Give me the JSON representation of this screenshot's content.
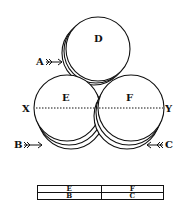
{
  "diagram": {
    "circles": [
      {
        "id": "D",
        "label": "D",
        "cx": 98,
        "cy": 49,
        "r": 32
      },
      {
        "id": "E",
        "label": "E",
        "cx": 67,
        "cy": 108,
        "r": 33
      },
      {
        "id": "F",
        "label": "F",
        "cx": 131,
        "cy": 108,
        "r": 33
      }
    ],
    "axis": {
      "left_label": "X",
      "right_label": "Y"
    },
    "arrows": [
      {
        "label": "A",
        "target": "D"
      },
      {
        "label": "B",
        "target": "E"
      },
      {
        "label": "C",
        "target": "F"
      }
    ]
  },
  "table": {
    "rows": [
      [
        "E",
        "F"
      ],
      [
        "B",
        "C"
      ]
    ]
  }
}
